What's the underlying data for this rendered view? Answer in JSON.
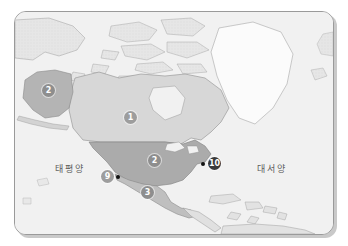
{
  "figure": {
    "kind": "map",
    "region": "North America",
    "frame": {
      "border_color": "#9a9a9a",
      "background": "#f2f2f2"
    }
  },
  "ocean_labels": [
    {
      "id": "pacific",
      "text": "태평양",
      "meaning": "Pacific Ocean"
    },
    {
      "id": "atlantic",
      "text": "대서양",
      "meaning": "Atlantic Ocean"
    }
  ],
  "labels": {
    "pacific": "태평양",
    "atlantic": "대서양"
  },
  "markers": [
    {
      "id": "m1",
      "number": "①",
      "glyph": "1",
      "area": "Canada",
      "shade": "light"
    },
    {
      "id": "m2a",
      "number": "②",
      "glyph": "2",
      "area": "Alaska",
      "shade": "mid"
    },
    {
      "id": "m2b",
      "number": "②",
      "glyph": "2",
      "area": "United States",
      "shade": "mid"
    },
    {
      "id": "m3",
      "number": "③",
      "glyph": "3",
      "area": "Mexico",
      "shade": "mid"
    },
    {
      "id": "m9",
      "number": "⑨",
      "glyph": "9",
      "area": "West Coast city",
      "shade": "light"
    },
    {
      "id": "m10",
      "number": "⑩",
      "glyph": "10",
      "area": "East Coast city",
      "shade": "dark"
    }
  ],
  "marker_text": {
    "one": "1",
    "two_alaska": "2",
    "two_usa": "2",
    "three": "3",
    "nine": "9",
    "ten": "10"
  },
  "shading": {
    "canada": "#d8d8d8",
    "usa": "#b0b0b0",
    "alaska": "#b5b5b5",
    "mexico": "#c2c2c2",
    "greenland": "#fbfbfb",
    "other_land": "#e4e4e4",
    "ocean": "#f1f1f1"
  }
}
